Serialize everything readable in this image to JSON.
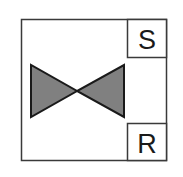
{
  "diagram": {
    "type": "valve-symbol",
    "colors": {
      "stroke": "#333333",
      "valve_fill": "#808080",
      "background": "#ffffff",
      "text": "#1a1a1a"
    },
    "set_box": {
      "label": "S"
    },
    "reset_box": {
      "label": "R"
    },
    "valve": {
      "shape": "bowtie"
    }
  }
}
